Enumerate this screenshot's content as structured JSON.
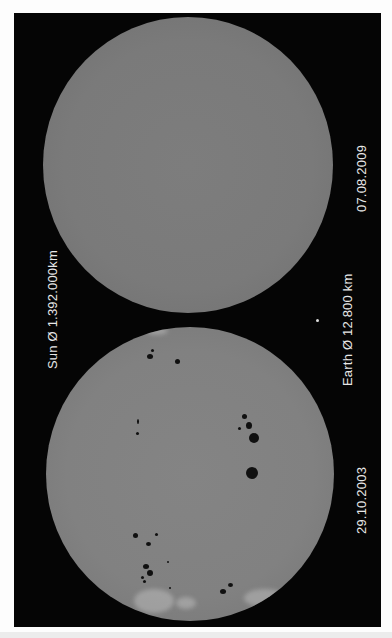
{
  "image": {
    "description": "Comparison of two solar disk photographs (rotated 90°)",
    "background_color": "#050505",
    "disk_color_2009": "#7a7a7a",
    "disk_color_2003": "#818181",
    "spot_color": "#101010"
  },
  "labels": {
    "date_2009": "07.08.2009",
    "date_2003": "29.10.2003",
    "sun_diameter": "Sun Ø 1.392.000km",
    "earth_diameter": "Earth Ø 12.800 km"
  },
  "suns": [
    {
      "name": "sun-2009",
      "date": "07.08.2009",
      "sunspots": 0
    },
    {
      "name": "sun-2003",
      "date": "29.10.2003",
      "sunspots": "many (large active groups)"
    }
  ],
  "earth_scale_marker": {
    "symbol": "•"
  }
}
